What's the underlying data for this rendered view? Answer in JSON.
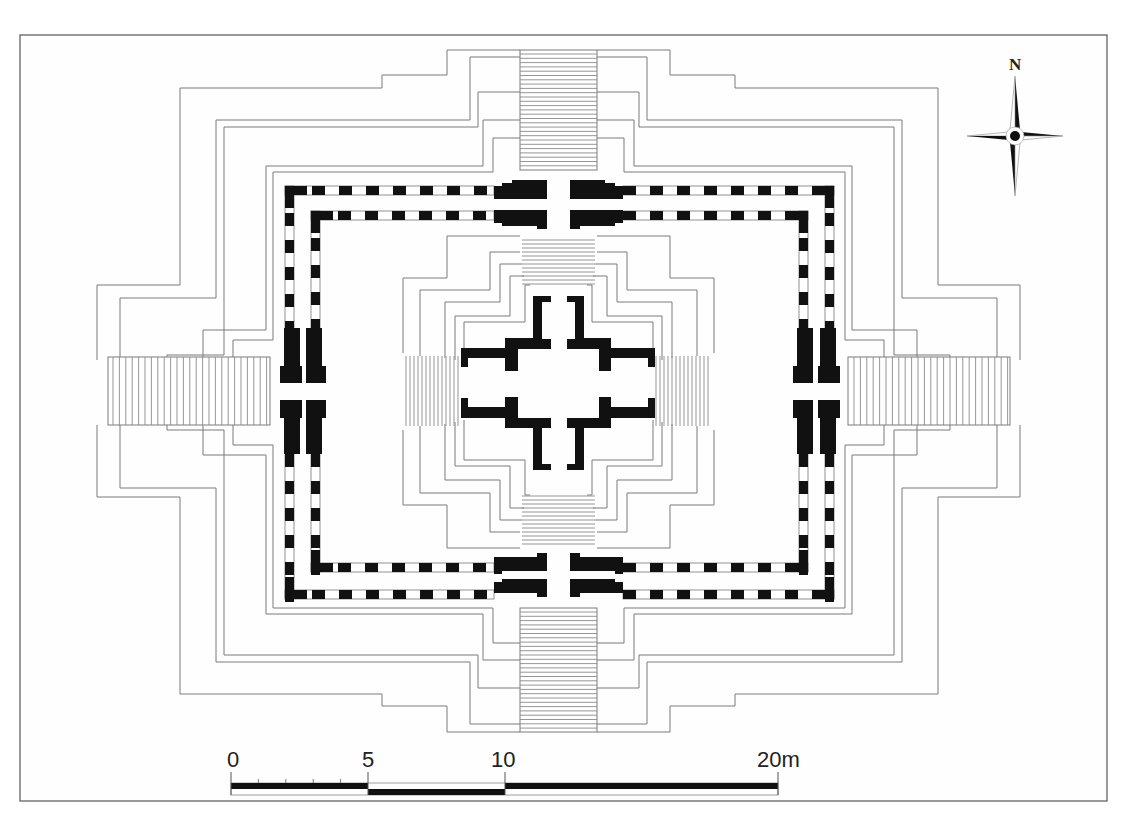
{
  "figure": {
    "type": "architectural-floor-plan",
    "north_label": "N",
    "scale_bar": {
      "labels": [
        "0",
        "5",
        "10",
        "20m"
      ],
      "values_m": [
        0,
        5,
        10,
        20
      ],
      "minor_ticks_between_0_and_5": 4
    },
    "colors": {
      "walls": "#111111",
      "outlines": "#7a7a7a",
      "frame": "#555555",
      "background": "#fefefe"
    },
    "elements": [
      "outer-stepped-platform-outlines",
      "north-staircase",
      "south-staircase",
      "west-staircase",
      "east-staircase",
      "outer-enclosure-wall-dashed",
      "inner-enclosure-wall-dashed",
      "gate-piers",
      "central-stepped-pyramid",
      "central-cruciform-sanctuary",
      "north-arrow",
      "scale-bar"
    ]
  }
}
